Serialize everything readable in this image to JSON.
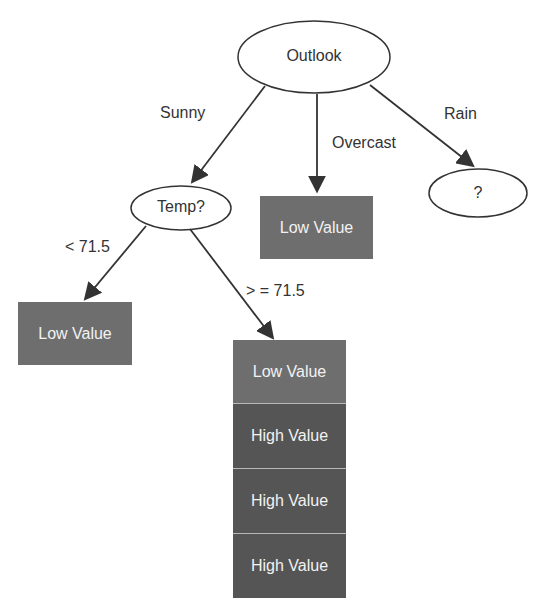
{
  "diagram": {
    "root": {
      "label": "Outlook"
    },
    "edges_root": {
      "sunny": "Sunny",
      "overcast": "Overcast",
      "rain": "Rain"
    },
    "temp_node": {
      "label": "Temp?"
    },
    "rain_node": {
      "label": "?"
    },
    "overcast_leaf": {
      "label": "Low Value"
    },
    "edges_temp": {
      "lt": "< 71.5",
      "ge": "> = 71.5"
    },
    "lt_leaf": {
      "label": "Low Value"
    },
    "ge_stack": [
      {
        "label": "Low Value",
        "kind": "low"
      },
      {
        "label": "High Value",
        "kind": "high"
      },
      {
        "label": "High Value",
        "kind": "high"
      },
      {
        "label": "High Value",
        "kind": "high"
      }
    ],
    "colors": {
      "low_fill": "#6e6e6e",
      "high_fill": "#555555",
      "line": "#333333"
    }
  }
}
